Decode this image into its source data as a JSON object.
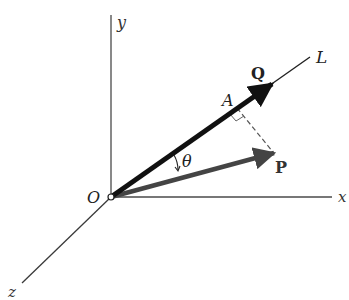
{
  "diagram": {
    "type": "vector-projection-3d",
    "colors": {
      "background": "#ffffff",
      "axis": "#3a3a3a",
      "vector_Q": "#111111",
      "vector_P": "#444444",
      "dashed": "#555555"
    },
    "labels": {
      "origin": "O",
      "x_axis": "x",
      "y_axis": "y",
      "z_axis": "z",
      "line": "L",
      "vector_Q": "Q",
      "vector_P": "P",
      "point_A": "A",
      "angle": "θ"
    },
    "elements": {
      "axes": [
        "x",
        "y",
        "z"
      ],
      "line_L": "through O, direction of Q",
      "vector_Q": "bold arrow from O along L",
      "vector_P": "arrow from O, angle θ below Q",
      "projection": "dashed perpendicular from tip of P to A on L, right-angle mark at A"
    }
  }
}
